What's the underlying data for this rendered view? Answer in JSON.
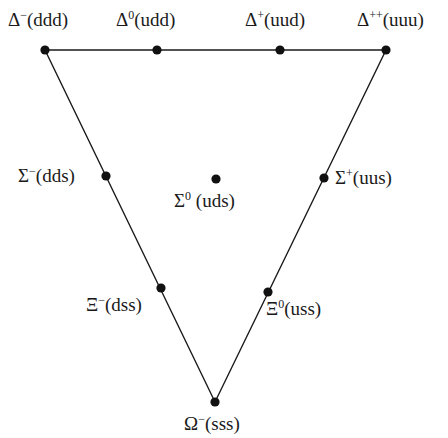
{
  "triangle": {
    "vertices": [
      [
        45,
        50
      ],
      [
        386,
        50
      ],
      [
        215,
        402
      ]
    ],
    "line_color": "#1a1a1a"
  },
  "particles": [
    {
      "id": "delta-minus",
      "symbol": "Δ",
      "charge": "−",
      "quarks": "(ddd)",
      "x": 45,
      "y": 50,
      "lx": 8,
      "ly": 26
    },
    {
      "id": "delta-zero",
      "symbol": "Δ",
      "charge": "0",
      "quarks": "(udd)",
      "x": 157,
      "y": 50,
      "lx": 116,
      "ly": 26
    },
    {
      "id": "delta-plus",
      "symbol": "Δ",
      "charge": "+",
      "quarks": "(uud)",
      "x": 280,
      "y": 50,
      "lx": 245,
      "ly": 26
    },
    {
      "id": "delta-plusplus",
      "symbol": "Δ",
      "charge": "++",
      "quarks": "(uuu)",
      "x": 386,
      "y": 50,
      "lx": 357,
      "ly": 26
    },
    {
      "id": "sigma-minus",
      "symbol": "Σ",
      "charge": "−",
      "quarks": "(dds)",
      "x": 106,
      "y": 176,
      "lx": 18,
      "ly": 182
    },
    {
      "id": "sigma-zero",
      "symbol": "Σ",
      "charge": "0",
      "quarks": " (uds)",
      "x": 216,
      "y": 179,
      "lx": 174,
      "ly": 207
    },
    {
      "id": "sigma-plus",
      "symbol": "Σ",
      "charge": "+",
      "quarks": "(uus)",
      "x": 324,
      "y": 178,
      "lx": 335,
      "ly": 184
    },
    {
      "id": "xi-minus",
      "symbol": "Ξ",
      "charge": "−",
      "quarks": "(dss)",
      "x": 161,
      "y": 288,
      "lx": 86,
      "ly": 311
    },
    {
      "id": "xi-zero",
      "symbol": "Ξ",
      "charge": "0",
      "quarks": "(uss)",
      "x": 268,
      "y": 292,
      "lx": 266,
      "ly": 315
    },
    {
      "id": "omega-minus",
      "symbol": "Ω",
      "charge": "−",
      "quarks": "(sss)",
      "x": 215,
      "y": 402,
      "lx": 184,
      "ly": 430
    }
  ]
}
